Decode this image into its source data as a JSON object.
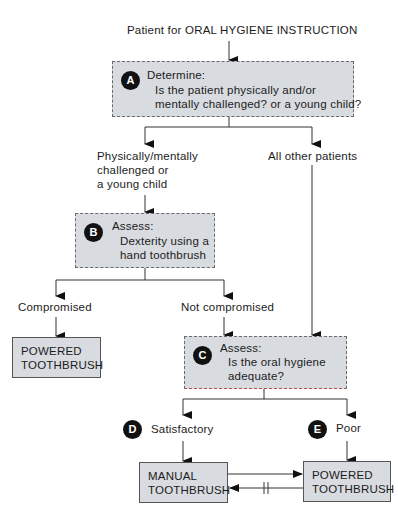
{
  "title": "Patient for ORAL HYGIENE INSTRUCTION",
  "nodes": {
    "A": {
      "badge": "A",
      "heading": "Determine:",
      "line1": "Is the patient physically and/or",
      "line2": "mentally challenged? or a young child?"
    },
    "B": {
      "badge": "B",
      "heading": "Assess:",
      "line1": "Dexterity using a",
      "line2": "hand toothbrush"
    },
    "C": {
      "badge": "C",
      "heading": "Assess:",
      "line1": "Is the oral hygiene",
      "line2": "adequate?"
    },
    "powered_left": {
      "line1": "POWERED",
      "line2": "TOOTHBRUSH"
    },
    "manual": {
      "line1": "MANUAL",
      "line2": "TOOTHBRUSH"
    },
    "powered_right": {
      "line1": "POWERED",
      "line2": "TOOTHBRUSH"
    }
  },
  "labels": {
    "challenged_1": "Physically/mentally",
    "challenged_2": "challenged or",
    "challenged_3": "a young child",
    "all_other": "All other patients",
    "compromised": "Compromised",
    "not_compromised": "Not compromised",
    "satisfactory": "Satisfactory",
    "satisfactory_badge": "D",
    "poor": "Poor",
    "poor_badge": "E"
  }
}
